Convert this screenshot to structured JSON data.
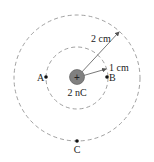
{
  "diagram": {
    "charge": {
      "label": "2 nC",
      "sign": "+",
      "fill": "#808080"
    },
    "inner_circle": {
      "label": "1 cm"
    },
    "outer_circle": {
      "label": "2 cm"
    },
    "points": [
      {
        "name": "A",
        "label": "A"
      },
      {
        "name": "B",
        "label": "B"
      },
      {
        "name": "C",
        "label": "C"
      }
    ],
    "colors": {
      "dashed": "#888888",
      "arrow": "#555555",
      "point": "#111111"
    }
  }
}
